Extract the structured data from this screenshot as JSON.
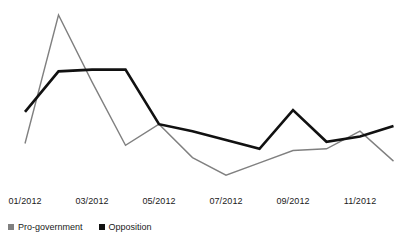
{
  "chart_data": {
    "type": "line",
    "title": "",
    "subtitle": "",
    "xlabel": "",
    "ylabel": "",
    "grid": false,
    "legend_position": "bottom-left",
    "x": [
      "01/2012",
      "02/2012",
      "03/2012",
      "04/2012",
      "05/2012",
      "06/2012",
      "07/2012",
      "08/2012",
      "09/2012",
      "10/2012",
      "11/2012",
      "12/2012"
    ],
    "tick_labels": [
      "01/2012",
      "03/2012",
      "05/2012",
      "07/2012",
      "09/2012",
      "11/2012"
    ],
    "tick_indices": [
      0,
      2,
      4,
      6,
      8,
      10
    ],
    "ylim": [
      0,
      100
    ],
    "series": [
      {
        "name": "Pro-government",
        "color": "#808080",
        "values": [
          23,
          96,
          58,
          22,
          34,
          15,
          5,
          12,
          19,
          20,
          30,
          13
        ]
      },
      {
        "name": "Opposition",
        "color": "#111111",
        "values": [
          41,
          64,
          65,
          65,
          34,
          30,
          25,
          20,
          42,
          24,
          27,
          33
        ]
      }
    ]
  },
  "legend": {
    "items": [
      {
        "label": "Pro-government",
        "color": "#808080"
      },
      {
        "label": "Opposition",
        "color": "#111111"
      }
    ]
  }
}
